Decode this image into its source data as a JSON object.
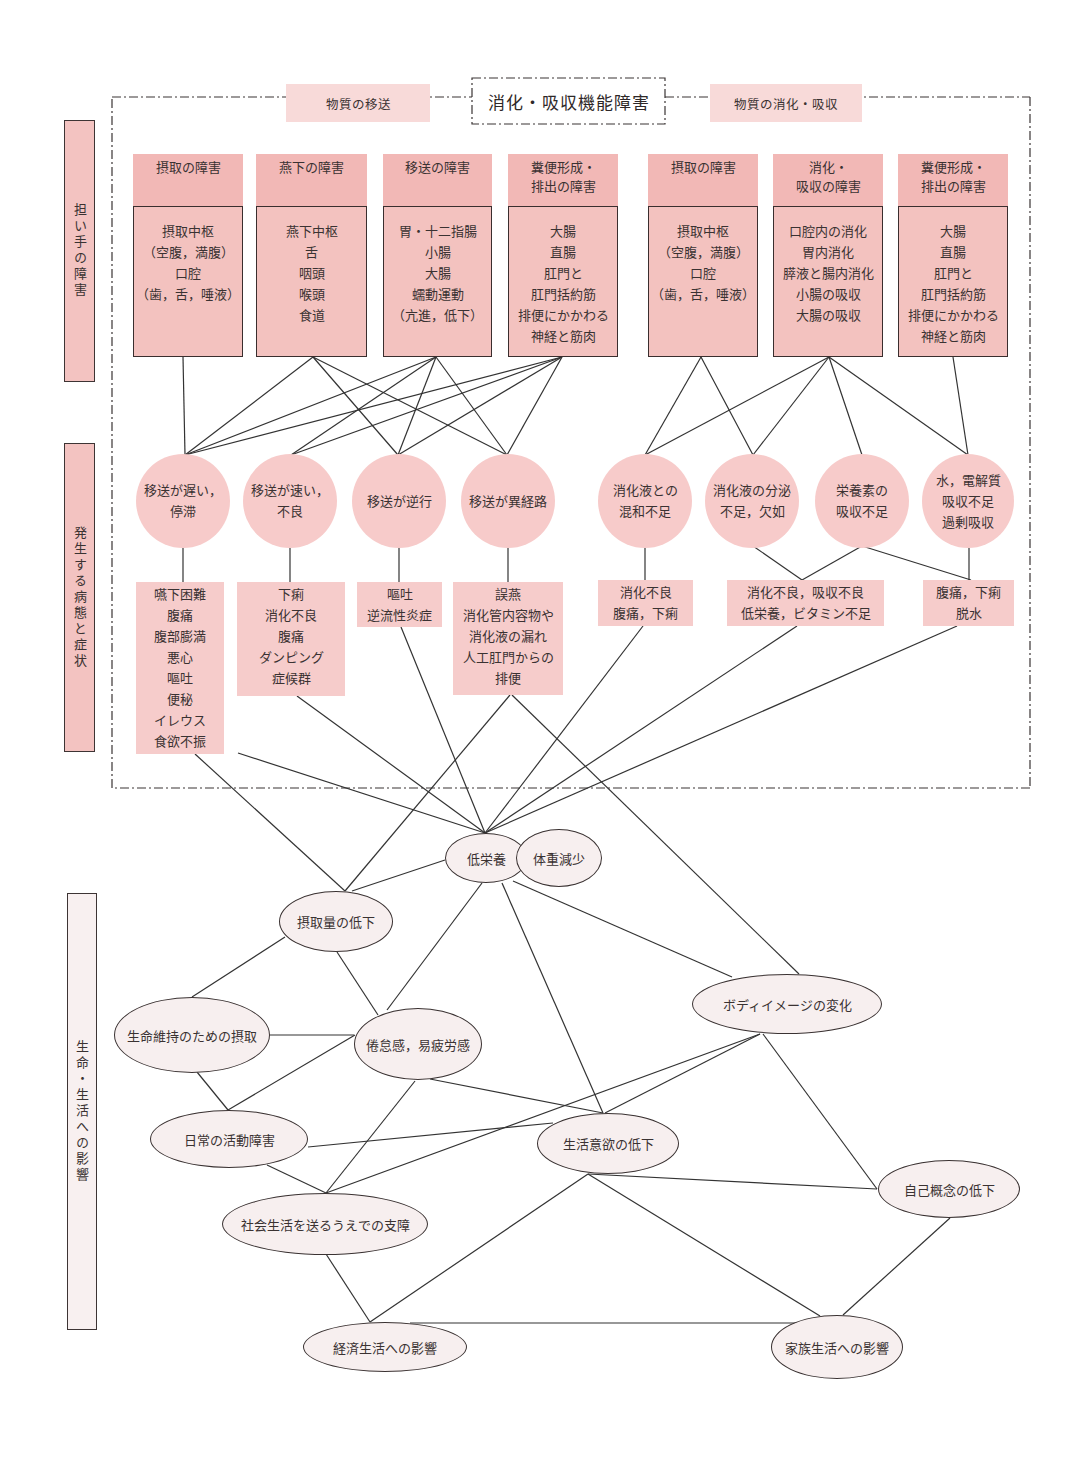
{
  "title": "消化・吸収機能障害",
  "groups": {
    "transport": "物質の移送",
    "digestion": "物質の消化・吸収"
  },
  "side_labels": [
    "担い手の障害",
    "発生する病態と症状",
    "生命・生活への影響"
  ],
  "carriers": [
    {
      "header": "摂取の障害",
      "body": "摂取中枢\n（空腹，満腹）\n口腔\n（歯，舌，唾液）"
    },
    {
      "header": "燕下の障害",
      "body": "燕下中枢\n舌\n咽頭\n喉頭\n食道"
    },
    {
      "header": "移送の障害",
      "body": "胃・十二指腸\n小腸\n大腸\n蠕動運動\n（亢進，低下）"
    },
    {
      "header": "糞便形成・\n排出の障害",
      "body": "大腸\n直腸\n肛門と\n肛門括約筋\n排便にかかわる\n神経と筋肉"
    },
    {
      "header": "摂取の障害",
      "body": "摂取中枢\n（空腹，満腹）\n口腔\n（歯，舌，唾液）"
    },
    {
      "header": "消化・\n吸収の障害",
      "body": "口腔内の消化\n胃内消化\n膵液と腸内消化\n小腸の吸収\n大腸の吸収"
    },
    {
      "header": "糞便形成・\n排出の障害",
      "body": "大腸\n直腸\n肛門と\n肛門括約筋\n排便にかかわる\n神経と筋肉"
    }
  ],
  "pathologies": [
    "移送が遅い，\n停滞",
    "移送が速い，\n不良",
    "移送が逆行",
    "移送が異経路",
    "消化液との\n混和不足",
    "消化液の分泌\n不足，欠如",
    "栄養素の\n吸収不足",
    "水，電解質\n吸収不足\n過剰吸収"
  ],
  "symptoms": [
    "嚥下困難\n腹痛\n腹部膨満\n悪心\n嘔吐\n便秘\nイレウス\n食欲不振",
    "下痢\n消化不良\n腹痛\nダンピング\n症候群",
    "嘔吐\n逆流性炎症",
    "誤燕\n消化管内容物や\n消化液の漏れ\n人工肛門からの\n排便",
    "消化不良\n腹痛，下痢",
    "消化不良，吸収不良\n低栄養，ビタミン不足",
    "腹痛，下痢\n脱水"
  ],
  "effects": {
    "malnutrition": "低栄養",
    "weight_loss": "体重減少",
    "intake_decline": "摂取量の低下",
    "intake_for_life": "生命維持のための摂取",
    "fatigue": "倦怠感，易疲労感",
    "body_image": "ボディイメージの変化",
    "daily_activity": "日常の活動障害",
    "motivation_decline": "生活意欲の低下",
    "self_concept": "自己概念の低下",
    "social_life": "社会生活を送るうえでの支障",
    "economic_life": "経済生活への影響",
    "family_life": "家族生活への影響"
  },
  "relationships": {
    "carrier_to_pathology": [
      [
        "carrier1",
        "path1"
      ],
      [
        "carrier2",
        "path1"
      ],
      [
        "carrier2",
        "path3"
      ],
      [
        "carrier2",
        "path4"
      ],
      [
        "carrier3",
        "path1"
      ],
      [
        "carrier3",
        "path2"
      ],
      [
        "carrier3",
        "path3"
      ],
      [
        "carrier3",
        "path4"
      ],
      [
        "carrier4",
        "path1"
      ],
      [
        "carrier4",
        "path2"
      ],
      [
        "carrier4",
        "path3"
      ],
      [
        "carrier4",
        "path4"
      ],
      [
        "carrier5",
        "path5"
      ],
      [
        "carrier5",
        "path6"
      ],
      [
        "carrier6",
        "path5"
      ],
      [
        "carrier6",
        "path6"
      ],
      [
        "carrier6",
        "path7"
      ],
      [
        "carrier6",
        "path8"
      ],
      [
        "carrier7",
        "path8"
      ]
    ],
    "pathology_to_symptom": [
      [
        "path1",
        "sym1"
      ],
      [
        "path2",
        "sym2"
      ],
      [
        "path3",
        "sym3"
      ],
      [
        "path4",
        "sym4"
      ],
      [
        "path5",
        "sym5"
      ],
      [
        "path6",
        "sym6"
      ],
      [
        "path7",
        "sym6"
      ],
      [
        "path7",
        "sym7"
      ],
      [
        "path8",
        "sym7"
      ]
    ],
    "symptom_to_effect": [
      [
        "sym1",
        "intake_decline"
      ],
      [
        "sym1",
        "malnutrition"
      ],
      [
        "sym2",
        "malnutrition"
      ],
      [
        "sym3",
        "malnutrition"
      ],
      [
        "sym4",
        "intake_decline"
      ],
      [
        "sym4",
        "body_image"
      ],
      [
        "sym5",
        "malnutrition"
      ],
      [
        "sym6",
        "malnutrition"
      ],
      [
        "sym7",
        "malnutrition"
      ]
    ],
    "effect_to_effect": [
      [
        "malnutrition",
        "intake_decline"
      ],
      [
        "malnutrition",
        "fatigue"
      ],
      [
        "malnutrition",
        "motivation_decline"
      ],
      [
        "malnutrition",
        "body_image"
      ],
      [
        "intake_decline",
        "intake_for_life"
      ],
      [
        "intake_decline",
        "fatigue"
      ],
      [
        "intake_for_life",
        "fatigue"
      ],
      [
        "intake_for_life",
        "daily_activity"
      ],
      [
        "fatigue",
        "daily_activity"
      ],
      [
        "fatigue",
        "social_life"
      ],
      [
        "fatigue",
        "motivation_decline"
      ],
      [
        "daily_activity",
        "motivation_decline"
      ],
      [
        "daily_activity",
        "social_life"
      ],
      [
        "body_image",
        "social_life"
      ],
      [
        "body_image",
        "motivation_decline"
      ],
      [
        "body_image",
        "self_concept"
      ],
      [
        "motivation_decline",
        "self_concept"
      ],
      [
        "motivation_decline",
        "family_life"
      ],
      [
        "motivation_decline",
        "economic_life"
      ],
      [
        "self_concept",
        "family_life"
      ],
      [
        "social_life",
        "economic_life"
      ],
      [
        "economic_life",
        "family_life"
      ]
    ]
  },
  "colors": {
    "header_fill": "#f2b8b6",
    "body_fill": "#f3c2bf",
    "circle_fill": "#f7cbca",
    "symptom_fill": "#f6cccb",
    "group_label_fill": "#f8dad9",
    "effect_fill": "#f7efef",
    "line": "#333333"
  }
}
